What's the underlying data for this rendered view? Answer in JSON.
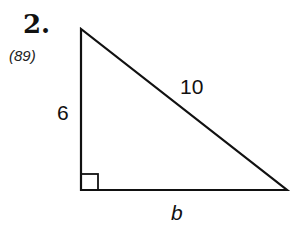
{
  "problem": {
    "number": "2.",
    "reference": "(89)"
  },
  "diagram": {
    "shape": "right triangle",
    "labels": {
      "leg_vertical": "6",
      "hypotenuse": "10",
      "leg_horizontal": "b"
    },
    "right_angle_marker": "bottom-left"
  }
}
